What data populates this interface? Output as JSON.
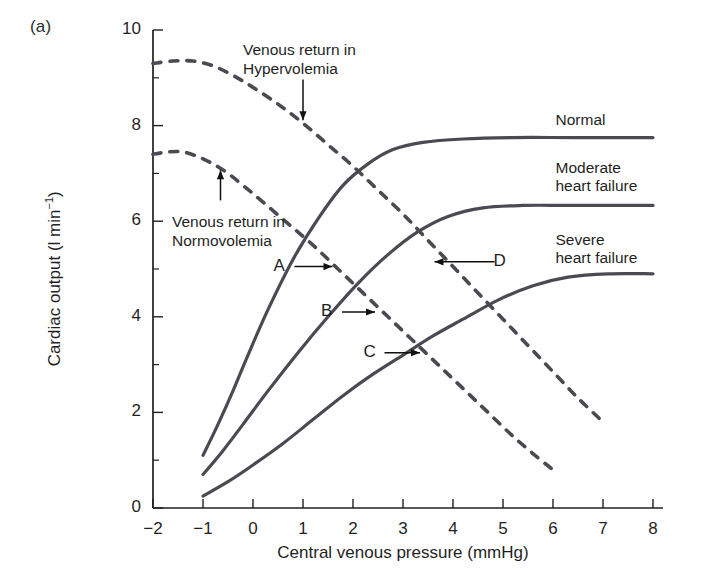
{
  "figure": {
    "panel_label": "(a)",
    "background_color": "#ffffff",
    "curve_color": "#4a4a52",
    "axis_color": "#1f1f1f"
  },
  "chart_data": {
    "type": "line",
    "title": "",
    "xlabel": "Central venous pressure (mmHg)",
    "ylabel": "Cardiac output (l min⁻¹)",
    "ylabel_parts": {
      "main": "Cardiac output (l min",
      "exponent": "−1",
      "close": ")"
    },
    "xlim": [
      -2,
      8
    ],
    "ylim": [
      0,
      10
    ],
    "xticks": [
      -2,
      -1,
      0,
      1,
      2,
      3,
      4,
      5,
      6,
      7,
      8
    ],
    "xtick_labels": [
      "−2",
      "−1",
      "0",
      "1",
      "2",
      "3",
      "4",
      "5",
      "6",
      "7",
      "8"
    ],
    "yticks": [
      0,
      2,
      4,
      6,
      8,
      10
    ],
    "ytick_labels": [
      "0",
      "2",
      "4",
      "6",
      "8",
      "10"
    ],
    "yticks_minor": [
      1,
      3,
      5,
      7,
      9
    ],
    "grid": false,
    "legend_position": "inline-right",
    "series": [
      {
        "name": "Normal",
        "style": "solid",
        "label": "Normal",
        "label_x": 6.05,
        "label_y": 8.05,
        "points": [
          [
            -1.0,
            1.1
          ],
          [
            -0.7,
            1.75
          ],
          [
            -0.4,
            2.45
          ],
          [
            -0.1,
            3.2
          ],
          [
            0.3,
            4.15
          ],
          [
            0.8,
            5.2
          ],
          [
            1.3,
            6.05
          ],
          [
            1.8,
            6.75
          ],
          [
            2.3,
            7.2
          ],
          [
            2.8,
            7.5
          ],
          [
            3.4,
            7.65
          ],
          [
            4.2,
            7.72
          ],
          [
            5.2,
            7.75
          ],
          [
            6.4,
            7.75
          ],
          [
            8.0,
            7.75
          ]
        ]
      },
      {
        "name": "Moderate heart failure",
        "style": "solid",
        "label": "Moderate\nheart failure",
        "label_x": 6.05,
        "label_y": 7.05,
        "points": [
          [
            -1.0,
            0.7
          ],
          [
            -0.6,
            1.2
          ],
          [
            -0.2,
            1.75
          ],
          [
            0.3,
            2.45
          ],
          [
            0.9,
            3.25
          ],
          [
            1.5,
            4.0
          ],
          [
            2.1,
            4.7
          ],
          [
            2.7,
            5.3
          ],
          [
            3.3,
            5.78
          ],
          [
            3.9,
            6.1
          ],
          [
            4.6,
            6.28
          ],
          [
            5.4,
            6.33
          ],
          [
            6.4,
            6.33
          ],
          [
            8.0,
            6.33
          ]
        ]
      },
      {
        "name": "Severe heart failure",
        "style": "solid",
        "label": "Severe\nheart failure",
        "label_x": 6.05,
        "label_y": 5.55,
        "points": [
          [
            -1.0,
            0.25
          ],
          [
            -0.5,
            0.55
          ],
          [
            0.0,
            0.9
          ],
          [
            0.6,
            1.35
          ],
          [
            1.2,
            1.85
          ],
          [
            1.8,
            2.35
          ],
          [
            2.4,
            2.8
          ],
          [
            3.0,
            3.2
          ],
          [
            3.6,
            3.6
          ],
          [
            4.2,
            3.95
          ],
          [
            4.9,
            4.35
          ],
          [
            5.6,
            4.65
          ],
          [
            6.3,
            4.83
          ],
          [
            7.1,
            4.9
          ],
          [
            8.0,
            4.9
          ]
        ]
      },
      {
        "name": "Venous return in Hypervolemia",
        "style": "dashed",
        "label": "Venous return in\nHypervolemia",
        "points": [
          [
            -2.0,
            9.3
          ],
          [
            -1.6,
            9.35
          ],
          [
            -1.2,
            9.35
          ],
          [
            -0.8,
            9.25
          ],
          [
            -0.4,
            9.05
          ],
          [
            0.0,
            8.8
          ],
          [
            0.5,
            8.45
          ],
          [
            1.0,
            8.05
          ],
          [
            1.5,
            7.6
          ],
          [
            2.0,
            7.15
          ],
          [
            2.5,
            6.65
          ],
          [
            3.0,
            6.15
          ],
          [
            3.5,
            5.6
          ],
          [
            4.0,
            5.05
          ],
          [
            4.5,
            4.5
          ],
          [
            5.0,
            3.95
          ],
          [
            5.5,
            3.4
          ],
          [
            6.0,
            2.85
          ],
          [
            6.5,
            2.3
          ],
          [
            7.0,
            1.8
          ]
        ]
      },
      {
        "name": "Venous return in Normovolemia",
        "style": "dashed",
        "label": "Venous return in\nNormovolemia",
        "points": [
          [
            -2.0,
            7.4
          ],
          [
            -1.7,
            7.45
          ],
          [
            -1.4,
            7.45
          ],
          [
            -1.1,
            7.35
          ],
          [
            -0.8,
            7.2
          ],
          [
            -0.5,
            7.0
          ],
          [
            -0.2,
            6.75
          ],
          [
            0.2,
            6.4
          ],
          [
            0.7,
            5.95
          ],
          [
            1.2,
            5.5
          ],
          [
            1.7,
            5.0
          ],
          [
            2.2,
            4.5
          ],
          [
            2.7,
            4.0
          ],
          [
            3.2,
            3.5
          ],
          [
            3.7,
            3.0
          ],
          [
            4.2,
            2.5
          ],
          [
            4.7,
            2.0
          ],
          [
            5.2,
            1.5
          ],
          [
            5.7,
            1.05
          ],
          [
            6.0,
            0.8
          ]
        ]
      }
    ],
    "annotations": [
      {
        "id": "A",
        "label": "A",
        "x": 1.65,
        "y": 5.05,
        "label_x": 0.55,
        "label_y": 5.1,
        "arrow_dir": "right"
      },
      {
        "id": "B",
        "label": "B",
        "x": 2.5,
        "y": 4.1,
        "label_x": 1.5,
        "label_y": 4.2,
        "arrow_dir": "right"
      },
      {
        "id": "C",
        "label": "C",
        "x": 3.4,
        "y": 3.25,
        "label_x": 2.35,
        "label_y": 3.35,
        "arrow_dir": "right"
      },
      {
        "id": "D",
        "label": "D",
        "x": 3.55,
        "y": 5.15,
        "label_x": 4.95,
        "label_y": 5.2,
        "arrow_dir": "left"
      },
      {
        "id": "hyper",
        "label": "",
        "x": 1.0,
        "y": 8.05,
        "label_x": 1.0,
        "label_y": 9.3,
        "arrow_dir": "down"
      },
      {
        "id": "normo",
        "label": "",
        "x": -0.65,
        "y": 7.15,
        "label_x": -0.65,
        "label_y": 6.1,
        "arrow_dir": "up"
      }
    ]
  }
}
